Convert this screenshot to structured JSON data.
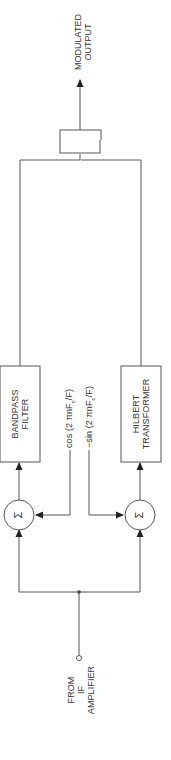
{
  "diagram": {
    "orientation": "rotated-90-ccw",
    "input": {
      "line1": "FROM",
      "line2": "IF",
      "line3": "AMPLIFIER"
    },
    "summer_top": {
      "symbol": "Σ"
    },
    "summer_bottom": {
      "symbol": "Σ"
    },
    "osc_cos": {
      "text": "cos (2 πnF",
      "sub": "c",
      "tail": "/F)"
    },
    "osc_sin": {
      "text": "−sin (2 πnF",
      "sub": "c",
      "tail": "/F)"
    },
    "bandpass": {
      "line1": "BANDPASS",
      "line2": "FILTER"
    },
    "hilbert": {
      "line1": "HILBERT",
      "line2": "TRANSFORMER"
    },
    "adder": {
      "symbol": "+"
    },
    "lowpass": {
      "line1": "LOW-PASS",
      "line2": "FILTER"
    },
    "output": {
      "line1": "MODULATED",
      "line2": "OUTPUT"
    },
    "line_color": "#555555"
  }
}
